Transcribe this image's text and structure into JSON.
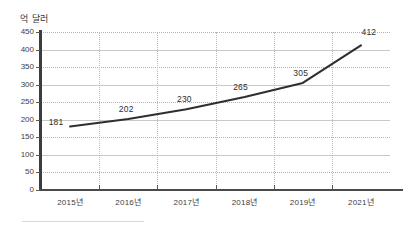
{
  "chart_data": {
    "type": "line",
    "title": "",
    "subtitle": "",
    "xlabel": "",
    "ylabel": "억 달러",
    "ylim": [
      0,
      450
    ],
    "ytick_step": 50,
    "grid": true,
    "legend": "none",
    "line_color": "#2f2f2f",
    "categories": [
      "2015년",
      "2016년",
      "2017년",
      "2018년",
      "2019년",
      "2021년"
    ],
    "values": [
      181,
      202,
      230,
      265,
      305,
      412
    ],
    "point_labels": [
      "181",
      "202",
      "230",
      "265",
      "305",
      "412"
    ],
    "ytick_labels": [
      "0",
      "50",
      "100",
      "150",
      "200",
      "250",
      "300",
      "350",
      "400",
      "450"
    ]
  },
  "axis": {
    "y_caption": "억 달러"
  }
}
